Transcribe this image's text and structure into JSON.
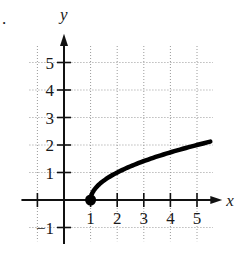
{
  "problem_label": ".",
  "chart_data": {
    "type": "line",
    "title": "",
    "xlabel": "x",
    "ylabel": "y",
    "xlim": [
      -1.3,
      5.9
    ],
    "ylim": [
      -1.4,
      5.9
    ],
    "grid": true,
    "x_ticks": [
      "1",
      "2",
      "3",
      "4",
      "5"
    ],
    "y_ticks": [
      "-1",
      "1",
      "2",
      "3",
      "4",
      "5"
    ],
    "x_tick_values": [
      1,
      2,
      3,
      4,
      5
    ],
    "y_tick_values": [
      -1,
      1,
      2,
      3,
      4,
      5
    ],
    "series": [
      {
        "name": "y = sqrt(x - 1)",
        "x": [
          1,
          1.1,
          1.25,
          1.5,
          2,
          2.5,
          3,
          3.5,
          4,
          4.5,
          5,
          5.5
        ],
        "y": [
          0,
          0.32,
          0.5,
          0.71,
          1.0,
          1.22,
          1.41,
          1.58,
          1.73,
          1.87,
          2.0,
          2.12
        ]
      }
    ],
    "endpoint": {
      "x": 1,
      "y": 0,
      "style": "closed-dot"
    }
  },
  "colors": {
    "curve": "#000000",
    "grid": "#9a9a9a",
    "axis": "#111111"
  }
}
